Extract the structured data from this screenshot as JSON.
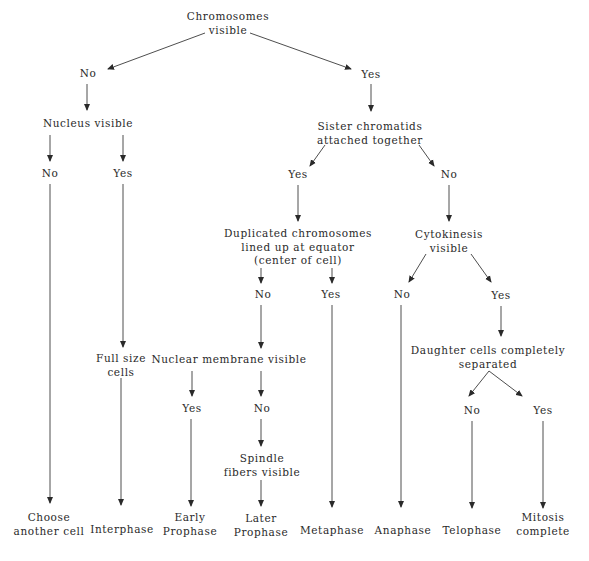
{
  "diagram": {
    "colors": {
      "text": "#2a2a2a",
      "line": "#3a3a3a",
      "background": "#ffffff"
    },
    "nodes": {
      "chromosomes_visible": {
        "lines": [
          "Chromosomes",
          "visible"
        ],
        "x": 228,
        "y": 23
      },
      "chromosomes_no": {
        "lines": [
          "No"
        ],
        "x": 88,
        "y": 74
      },
      "chromosomes_yes": {
        "lines": [
          "Yes"
        ],
        "x": 371,
        "y": 75
      },
      "nucleus_visible": {
        "lines": [
          "Nucleus visible"
        ],
        "x": 88,
        "y": 124
      },
      "nucleus_no": {
        "lines": [
          "No"
        ],
        "x": 50,
        "y": 174
      },
      "nucleus_yes": {
        "lines": [
          "Yes"
        ],
        "x": 123,
        "y": 174
      },
      "sister_chromatids": {
        "lines": [
          "Sister chromatids",
          "attached together"
        ],
        "x": 370,
        "y": 133
      },
      "sister_yes": {
        "lines": [
          "Yes"
        ],
        "x": 298,
        "y": 175
      },
      "sister_no": {
        "lines": [
          "No"
        ],
        "x": 449,
        "y": 175
      },
      "duplicated_chromosomes": {
        "lines": [
          "Duplicated chromosomes",
          "lined up at equator",
          "(center of cell)"
        ],
        "x": 298,
        "y": 247
      },
      "cytokinesis_visible": {
        "lines": [
          "Cytokinesis",
          "visible"
        ],
        "x": 449,
        "y": 241
      },
      "duplicated_no": {
        "lines": [
          "No"
        ],
        "x": 263,
        "y": 295
      },
      "duplicated_yes": {
        "lines": [
          "Yes"
        ],
        "x": 331,
        "y": 295
      },
      "cytokinesis_no": {
        "lines": [
          "No"
        ],
        "x": 402,
        "y": 295
      },
      "cytokinesis_yes": {
        "lines": [
          "Yes"
        ],
        "x": 501,
        "y": 296
      },
      "full_size_cells": {
        "lines": [
          "Full size",
          "cells"
        ],
        "x": 121,
        "y": 365
      },
      "nuclear_membrane_visible": {
        "lines": [
          "Nuclear membrane visible"
        ],
        "x": 229,
        "y": 360
      },
      "daughter_cells_separated": {
        "lines": [
          "Daughter cells completely",
          "separated"
        ],
        "x": 488,
        "y": 357
      },
      "membrane_yes": {
        "lines": [
          "Yes"
        ],
        "x": 192,
        "y": 409
      },
      "membrane_no": {
        "lines": [
          "No"
        ],
        "x": 262,
        "y": 409
      },
      "daughter_no": {
        "lines": [
          "No"
        ],
        "x": 472,
        "y": 411
      },
      "daughter_yes": {
        "lines": [
          "Yes"
        ],
        "x": 543,
        "y": 411
      },
      "spindle_fibers_visible": {
        "lines": [
          "Spindle",
          "fibers visible"
        ],
        "x": 262,
        "y": 465
      },
      "choose_another_cell": {
        "lines": [
          "Choose",
          "another cell"
        ],
        "x": 49,
        "y": 524
      },
      "interphase": {
        "lines": [
          "Interphase"
        ],
        "x": 122,
        "y": 530
      },
      "early_prophase": {
        "lines": [
          "Early",
          "Prophase"
        ],
        "x": 190,
        "y": 524
      },
      "later_prophase": {
        "lines": [
          "Later",
          "Prophase"
        ],
        "x": 261,
        "y": 525
      },
      "metaphase": {
        "lines": [
          "Metaphase"
        ],
        "x": 332,
        "y": 531
      },
      "anaphase": {
        "lines": [
          "Anaphase"
        ],
        "x": 403,
        "y": 531
      },
      "telophase": {
        "lines": [
          "Telophase"
        ],
        "x": 472,
        "y": 531
      },
      "mitosis_complete": {
        "lines": [
          "Mitosis",
          "complete"
        ],
        "x": 543,
        "y": 524
      }
    },
    "edges": [
      {
        "from": "chromosomes_visible",
        "to": "chromosomes_no",
        "x1": 205,
        "y1": 33,
        "x2": 108,
        "y2": 69
      },
      {
        "from": "chromosomes_visible",
        "to": "chromosomes_yes",
        "x1": 250,
        "y1": 33,
        "x2": 351,
        "y2": 69
      },
      {
        "from": "chromosomes_no",
        "to": "nucleus_visible",
        "x1": 87,
        "y1": 84,
        "x2": 87,
        "y2": 110
      },
      {
        "from": "chromosomes_yes",
        "to": "sister_chromatids",
        "x1": 371,
        "y1": 84,
        "x2": 371,
        "y2": 111
      },
      {
        "from": "nucleus_visible",
        "to": "nucleus_no",
        "x1": 50,
        "y1": 135,
        "x2": 50,
        "y2": 161
      },
      {
        "from": "nucleus_visible",
        "to": "nucleus_yes",
        "x1": 123,
        "y1": 135,
        "x2": 123,
        "y2": 161
      },
      {
        "from": "sister_chromatids",
        "to": "sister_yes",
        "x1": 325,
        "y1": 145,
        "x2": 310,
        "y2": 166
      },
      {
        "from": "sister_chromatids",
        "to": "sister_no",
        "x1": 419,
        "y1": 145,
        "x2": 434,
        "y2": 166
      },
      {
        "from": "sister_yes",
        "to": "duplicated_chromosomes",
        "x1": 298,
        "y1": 185,
        "x2": 298,
        "y2": 221
      },
      {
        "from": "sister_no",
        "to": "cytokinesis_visible",
        "x1": 449,
        "y1": 185,
        "x2": 449,
        "y2": 221
      },
      {
        "from": "nucleus_no",
        "to": "choose_another_cell",
        "x1": 50,
        "y1": 184,
        "x2": 50,
        "y2": 503
      },
      {
        "from": "nucleus_yes",
        "to": "full_size_cells",
        "x1": 123,
        "y1": 184,
        "x2": 123,
        "y2": 347
      },
      {
        "from": "duplicated_chromosomes",
        "to": "duplicated_no",
        "x1": 261,
        "y1": 268,
        "x2": 261,
        "y2": 283
      },
      {
        "from": "duplicated_chromosomes",
        "to": "duplicated_yes",
        "x1": 332,
        "y1": 268,
        "x2": 332,
        "y2": 283
      },
      {
        "from": "cytokinesis_visible",
        "to": "cytokinesis_no",
        "x1": 426,
        "y1": 254,
        "x2": 409,
        "y2": 282
      },
      {
        "from": "cytokinesis_visible",
        "to": "cytokinesis_yes",
        "x1": 471,
        "y1": 254,
        "x2": 491,
        "y2": 282
      },
      {
        "from": "duplicated_no",
        "to": "nuclear_membrane_visible",
        "x1": 261,
        "y1": 305,
        "x2": 261,
        "y2": 348
      },
      {
        "from": "duplicated_yes",
        "to": "metaphase",
        "x1": 332,
        "y1": 305,
        "x2": 332,
        "y2": 507
      },
      {
        "from": "cytokinesis_no",
        "to": "anaphase",
        "x1": 401,
        "y1": 305,
        "x2": 401,
        "y2": 507
      },
      {
        "from": "cytokinesis_yes",
        "to": "daughter_cells_separated",
        "x1": 501,
        "y1": 306,
        "x2": 501,
        "y2": 336
      },
      {
        "from": "full_size_cells",
        "to": "interphase",
        "x1": 121,
        "y1": 378,
        "x2": 121,
        "y2": 505
      },
      {
        "from": "nuclear_membrane_visible",
        "to": "membrane_yes",
        "x1": 192,
        "y1": 371,
        "x2": 192,
        "y2": 396
      },
      {
        "from": "nuclear_membrane_visible",
        "to": "membrane_no",
        "x1": 261,
        "y1": 371,
        "x2": 261,
        "y2": 396
      },
      {
        "from": "daughter_cells_separated",
        "to": "daughter_no",
        "x1": 489,
        "y1": 371,
        "x2": 469,
        "y2": 396
      },
      {
        "from": "daughter_cells_separated",
        "to": "daughter_yes",
        "x1": 489,
        "y1": 371,
        "x2": 522,
        "y2": 396
      },
      {
        "from": "membrane_yes",
        "to": "early_prophase",
        "x1": 191,
        "y1": 419,
        "x2": 191,
        "y2": 506
      },
      {
        "from": "membrane_no",
        "to": "spindle_fibers_visible",
        "x1": 261,
        "y1": 419,
        "x2": 261,
        "y2": 446
      },
      {
        "from": "spindle_fibers_visible",
        "to": "later_prophase",
        "x1": 261,
        "y1": 480,
        "x2": 261,
        "y2": 506
      },
      {
        "from": "daughter_no",
        "to": "telophase",
        "x1": 472,
        "y1": 421,
        "x2": 472,
        "y2": 508
      },
      {
        "from": "daughter_yes",
        "to": "mitosis_complete",
        "x1": 543,
        "y1": 421,
        "x2": 543,
        "y2": 508
      }
    ]
  }
}
